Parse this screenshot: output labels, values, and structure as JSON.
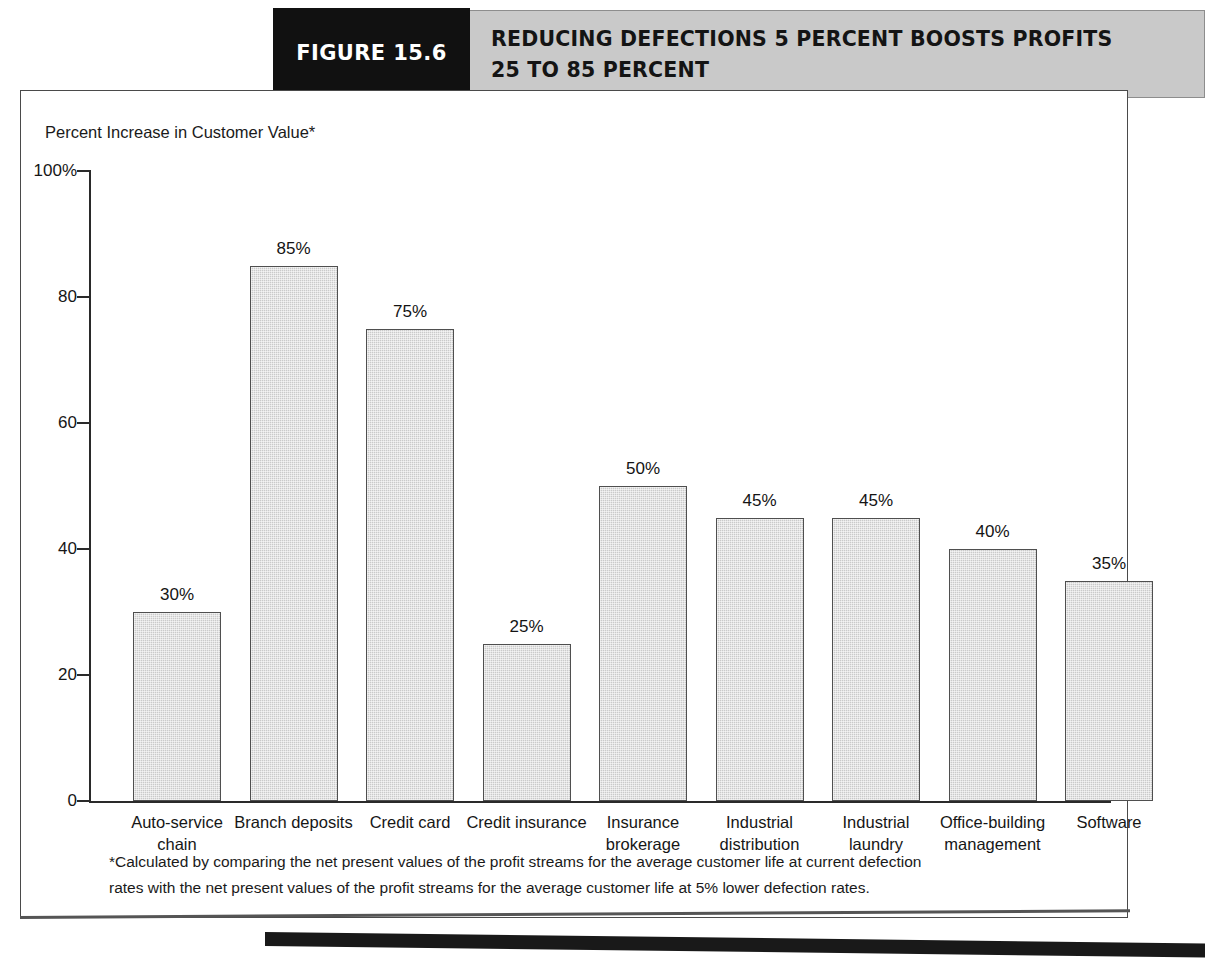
{
  "header": {
    "figure_number": "FIGURE 15.6",
    "title_line1": "REDUCING DEFECTIONS 5 PERCENT BOOSTS PROFITS",
    "title_line2": "25 TO 85 PERCENT"
  },
  "footnote": {
    "line1": "*Calculated by comparing the net present values of the profit streams for the average customer life at current defection",
    "line2": "rates with the net present values of the profit streams for the average customer life at 5% lower defection rates."
  },
  "chart_data": {
    "type": "bar",
    "title": "REDUCING DEFECTIONS 5 PERCENT BOOSTS PROFITS 25 TO 85 PERCENT",
    "ylabel": "Percent Increase in Customer Value*",
    "xlabel": "",
    "ylim": [
      0,
      100
    ],
    "grid": false,
    "legend": "none",
    "y_ticks": [
      0,
      20,
      40,
      60,
      80,
      100
    ],
    "y_tick_labels": [
      "0",
      "20",
      "40",
      "60",
      "80",
      "100%"
    ],
    "categories": [
      "Auto-service chain",
      "Branch deposits",
      "Credit card",
      "Credit insurance",
      "Insurance brokerage",
      "Industrial distribution",
      "Industrial laundry",
      "Office-building management",
      "Software"
    ],
    "category_lines": [
      [
        "Auto-service",
        "chain"
      ],
      [
        "Branch deposits",
        ""
      ],
      [
        "Credit card",
        ""
      ],
      [
        "Credit insurance",
        ""
      ],
      [
        "Insurance",
        "brokerage"
      ],
      [
        "Industrial",
        "distribution"
      ],
      [
        "Industrial",
        "laundry"
      ],
      [
        "Office-building",
        "management"
      ],
      [
        "Software",
        ""
      ]
    ],
    "values": [
      30,
      85,
      75,
      25,
      50,
      45,
      45,
      40,
      35
    ],
    "value_labels": [
      "30%",
      "85%",
      "75%",
      "25%",
      "50%",
      "45%",
      "45%",
      "40%",
      "35%"
    ],
    "bar_fill": "#cacaca",
    "bar_edge": "#4f4f4f"
  },
  "colors": {
    "figure_block": "#111111",
    "header_band": "#c9c9c9",
    "panel_border": "#4a4a4a",
    "bottom_rule": "#191919"
  }
}
